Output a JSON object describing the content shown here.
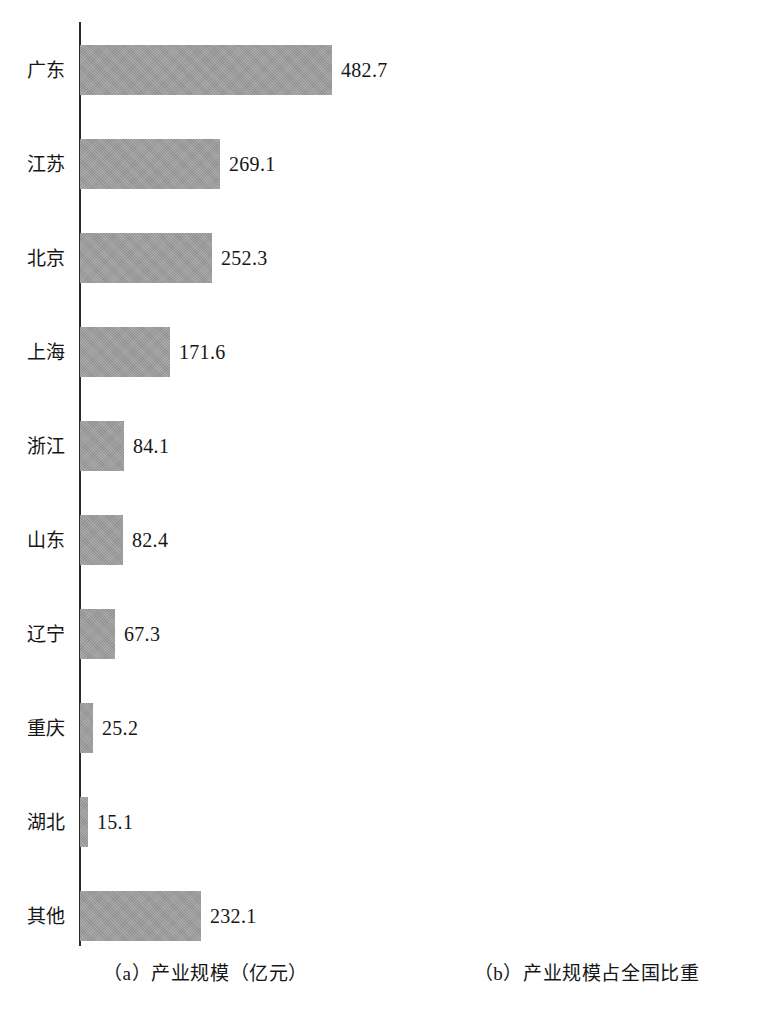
{
  "chart_data": [
    {
      "type": "bar",
      "orientation": "horizontal",
      "id": "panel-a",
      "title": "（a）产业规模（亿元）",
      "caption": "（a）产业规模（亿元）",
      "xlabel": "",
      "ylabel": "",
      "unit": "亿元",
      "grid": false,
      "legend": "none",
      "axis": "category-axis-left",
      "xlim": [
        0,
        482.7
      ],
      "categories": [
        "广东",
        "江苏",
        "北京",
        "上海",
        "浙江",
        "山东",
        "辽宁",
        "重庆",
        "湖北",
        "其他"
      ],
      "values": [
        482.7,
        269.1,
        252.3,
        171.6,
        84.1,
        82.4,
        67.3,
        25.2,
        15.1,
        232.1
      ],
      "value_labels": [
        "482.7",
        "269.1",
        "252.3",
        "171.6",
        "84.1",
        "82.4",
        "67.3",
        "25.2",
        "15.1",
        "232.1"
      ],
      "px_per_unit": 0.5222,
      "bar_color": "#9b9b9b"
    },
    {
      "type": "bar",
      "orientation": "horizontal",
      "id": "panel-b",
      "title": "（b）产业规模占全国比重",
      "caption": "（b）产业规模占全国比重",
      "xlabel": "",
      "ylabel": "",
      "unit": "%",
      "grid": false,
      "legend": "none",
      "axis": "category-axis-left",
      "xlim": [
        0,
        28.7
      ],
      "categories": [
        "广东",
        "江苏",
        "北京",
        "上海",
        "浙江",
        "山东",
        "辽宁",
        "重庆",
        "湖北",
        "其他"
      ],
      "values": [
        28.7,
        16.0,
        15.0,
        10.2,
        5.0,
        4.9,
        4.0,
        1.5,
        0.9,
        13.8
      ],
      "value_labels": [
        "28.7%",
        "16.0%",
        "15.0%",
        "10.2%",
        "5.0%",
        "4.9%",
        "4.0%",
        "1.5%",
        "0.9%",
        "13.8%"
      ],
      "px_per_unit": 7.945,
      "bar_color": "#9b9b9b"
    }
  ],
  "panels": [
    {
      "key": "a",
      "caption": "（a）产业规模（亿元）",
      "rows": [
        {
          "label": "广东",
          "value_label": "482.7",
          "bar_px": 252
        },
        {
          "label": "江苏",
          "value_label": "269.1",
          "bar_px": 140
        },
        {
          "label": "北京",
          "value_label": "252.3",
          "bar_px": 132
        },
        {
          "label": "上海",
          "value_label": "171.6",
          "bar_px": 90
        },
        {
          "label": "浙江",
          "value_label": "84.1",
          "bar_px": 44
        },
        {
          "label": "山东",
          "value_label": "82.4",
          "bar_px": 43
        },
        {
          "label": "辽宁",
          "value_label": "67.3",
          "bar_px": 35
        },
        {
          "label": "重庆",
          "value_label": "25.2",
          "bar_px": 13
        },
        {
          "label": "湖北",
          "value_label": "15.1",
          "bar_px": 8
        },
        {
          "label": "其他",
          "value_label": "232.1",
          "bar_px": 121
        }
      ]
    },
    {
      "key": "b",
      "caption": "（b）产业规模占全国比重",
      "rows": [
        {
          "label": "广东",
          "value_label": "28.7%",
          "bar_px": 228
        },
        {
          "label": "江苏",
          "value_label": "16.0%",
          "bar_px": 127
        },
        {
          "label": "北京",
          "value_label": "15.0%",
          "bar_px": 119
        },
        {
          "label": "上海",
          "value_label": "10.2%",
          "bar_px": 81
        },
        {
          "label": "浙江",
          "value_label": "5.0%",
          "bar_px": 40
        },
        {
          "label": "山东",
          "value_label": "4.9%",
          "bar_px": 39
        },
        {
          "label": "辽宁",
          "value_label": "4.0%",
          "bar_px": 32
        },
        {
          "label": "重庆",
          "value_label": "1.5%",
          "bar_px": 12
        },
        {
          "label": "湖北",
          "value_label": "0.9%",
          "bar_px": 7
        },
        {
          "label": "其他",
          "value_label": "13.8%",
          "bar_px": 110
        }
      ]
    }
  ],
  "style": {
    "bar_color": "#9b9b9b",
    "axis_color": "#2b2b2b",
    "text_color": "#161616",
    "background": "#ffffff"
  },
  "layout": {
    "row_height": 94,
    "first_row_top": 23,
    "bar_height": 50,
    "axis_a_x": 79,
    "axis_b_x": 466,
    "label_gap": 9
  }
}
